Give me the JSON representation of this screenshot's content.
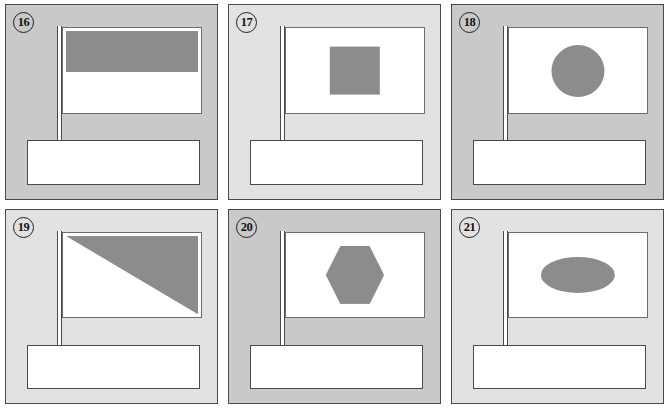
{
  "worksheet": {
    "title": "Flag shapes worksheet",
    "background_color": "#ffffff",
    "panel_dark_color": "#c9c9c9",
    "panel_light_color": "#e2e2e2",
    "shape_fill_color": "#8c8c8c",
    "flag_color": "#ffffff",
    "outline_color": "#4a4a4a",
    "columns": 3,
    "rows": 2
  },
  "panels": [
    {
      "number": "16",
      "shade": "dark",
      "shape": "horizontal-band",
      "shape_label": "horizontal band",
      "answer_line": ""
    },
    {
      "number": "17",
      "shade": "light",
      "shape": "square",
      "shape_label": "square",
      "answer_line": ""
    },
    {
      "number": "18",
      "shade": "dark",
      "shape": "circle",
      "shape_label": "circle",
      "answer_line": ""
    },
    {
      "number": "19",
      "shade": "light",
      "shape": "triangle",
      "shape_label": "triangle",
      "answer_line": ""
    },
    {
      "number": "20",
      "shade": "dark",
      "shape": "hexagon",
      "shape_label": "hexagon",
      "answer_line": ""
    },
    {
      "number": "21",
      "shade": "light",
      "shape": "ellipse",
      "shape_label": "ellipse",
      "answer_line": ""
    }
  ]
}
